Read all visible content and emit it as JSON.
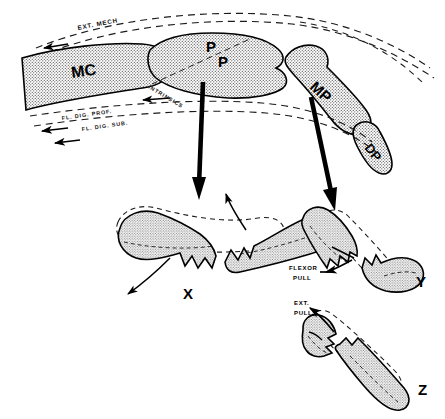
{
  "figure": {
    "background_color": "#ffffff",
    "ink_color": "#000000",
    "bone_fill_color": "#d8d8d8",
    "width": 445,
    "height": 419
  },
  "main_diagram": {
    "name": "lateral view of finger ray with tendon force vectors",
    "bones": [
      {
        "id": "mc",
        "label": "MC",
        "name": "metacarpal"
      },
      {
        "id": "pp",
        "label_line1": "P",
        "label_line2": "P",
        "name": "proximal phalanx"
      },
      {
        "id": "mp",
        "label": "MP",
        "name": "middle phalanx"
      },
      {
        "id": "dp",
        "label": "DP",
        "name": "distal phalanx"
      }
    ],
    "tendon_labels": [
      {
        "id": "ext-mech",
        "label": "EXT. MECH",
        "name": "extensor mechanism",
        "position": "dorsal"
      },
      {
        "id": "intrinsics",
        "label": "INTRINSICS",
        "name": "intrinsic muscles",
        "position": "volar-proximal"
      },
      {
        "id": "fl-dig-prof",
        "label": "FL. DIG. PROF.",
        "name": "flexor digitorum profundus",
        "position": "volar"
      },
      {
        "id": "fl-dig-sub",
        "label": "FL. DIG. SUB.",
        "name": "flexor digitorum sublimis",
        "position": "volar"
      }
    ]
  },
  "panels": [
    {
      "id": "x",
      "label": "X",
      "name": "proximal-phalanx-fracture-apex-volar",
      "annotations": []
    },
    {
      "id": "y",
      "label": "Y",
      "name": "middle-phalanx-fracture-proximal-to-insertion",
      "annotations": [
        {
          "id": "flexor-pull",
          "line1": "FLEXOR",
          "line2": "PULL",
          "label": "FLEXOR PULL"
        }
      ]
    },
    {
      "id": "z",
      "label": "Z",
      "name": "middle-phalanx-fracture-distal-to-insertion",
      "annotations": [
        {
          "id": "ext-pull",
          "line1": "EXT.",
          "line2": "PULL",
          "label": "EXT. PULL"
        }
      ]
    }
  ],
  "arrows": {
    "big_down_left": {
      "name": "pointer-to-panel-x"
    },
    "big_down_right": {
      "name": "pointer-to-panel-y"
    }
  }
}
